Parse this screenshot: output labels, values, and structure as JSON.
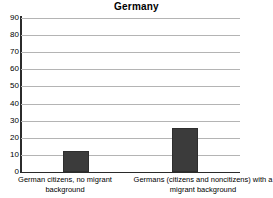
{
  "chart_data": {
    "type": "bar",
    "title": "Germany",
    "xlabel": "",
    "ylabel": "",
    "categories": [
      "German citizens, no migrant background",
      "Germans (citizens and noncitizens) with a migrant background"
    ],
    "values": [
      12,
      26
    ],
    "ylim": [
      0,
      90
    ],
    "yticks": [
      0,
      10,
      20,
      30,
      40,
      50,
      60,
      70,
      80,
      90
    ],
    "ytick_labels": [
      "0",
      "10",
      "20",
      "30",
      "40",
      "50",
      "60",
      "70",
      "80",
      "90"
    ],
    "grid": true,
    "legend": null,
    "series": [
      {
        "name": "Germany",
        "values": [
          12,
          26
        ],
        "color": "#3b3b3b"
      }
    ],
    "colors": {
      "bar_fill": "#3b3b3b",
      "bar_edge": "#2e2e2e",
      "gridline": "#b4b4b4",
      "axis": "#2b2b2b",
      "background": "#ffffff",
      "text": "#000000"
    }
  }
}
